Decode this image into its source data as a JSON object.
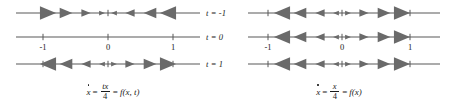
{
  "figure": {
    "colors": {
      "axis": "#595959",
      "arrow": "#6a6a6a",
      "text": "#1a1a1a",
      "background": "#ffffff"
    },
    "panels": [
      {
        "id": "left",
        "equation": {
          "lhs": "x",
          "eq1": "=",
          "numerator": "tx",
          "denominator": "4",
          "eq2": "=",
          "rhs": "f(x, t)",
          "plain": "ẋ = tx/4 = f(x, t)"
        },
        "tick_labels": [
          "-1",
          "0",
          "1"
        ],
        "tick_label_line": 1,
        "lines": [
          {
            "time_label": "t = -1",
            "time_value": "-1",
            "direction": "attracting",
            "description": "arrows point inward toward the fixed point at 0; larger arrows farther from 0"
          },
          {
            "time_label": "t = 0",
            "time_value": "0",
            "direction": "none",
            "description": "no flow; every point is a fixed point"
          },
          {
            "time_label": "t = 1",
            "time_value": "1",
            "direction": "repelling",
            "description": "arrows point outward away from the fixed point at 0; larger arrows farther from 0"
          }
        ]
      },
      {
        "id": "right",
        "equation": {
          "lhs": "x",
          "eq1": "=",
          "numerator": "x",
          "denominator": "4",
          "eq2": "=",
          "rhs": "f(x)",
          "plain": "ẋ = x/4 = f(x)"
        },
        "tick_labels": [
          "-1",
          "0",
          "1"
        ],
        "tick_label_line": 1,
        "lines": [
          {
            "time_label": "",
            "time_value": "-1",
            "direction": "repelling",
            "description": "arrows point outward away from the fixed point at 0; larger arrows farther from 0"
          },
          {
            "time_label": "",
            "time_value": "0",
            "direction": "repelling",
            "description": "arrows point outward away from the fixed point at 0; larger arrows farther from 0"
          },
          {
            "time_label": "",
            "time_value": "1",
            "direction": "repelling",
            "description": "arrows point outward away from the fixed point at 0; larger arrows farther from 0"
          }
        ]
      }
    ],
    "geometry": {
      "line_y": [
        13,
        37,
        64
      ],
      "left_line_x0": 16,
      "left_line_x1": 200,
      "right_line_x0": 248,
      "right_line_x1": 440,
      "left_tick_x": [
        43,
        108,
        173
      ],
      "right_tick_x": [
        268,
        342,
        410
      ],
      "arrow_offsets": [
        6,
        22,
        42,
        60
      ],
      "arrow_sizes": [
        2.5,
        4,
        5.5,
        7
      ]
    }
  }
}
